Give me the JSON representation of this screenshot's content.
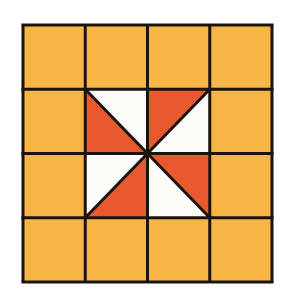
{
  "figure": {
    "title": "",
    "grid": {
      "rows": 4,
      "cols": 4
    },
    "colors": {
      "background_cell": "#f6b545",
      "accent": "#e9592f",
      "white": "#fdfbf8",
      "line": "#1a1410"
    },
    "center_cells": [
      {
        "row": 1,
        "col": 1,
        "diagonal": "tl-br",
        "accent_triangle": "bottom-left",
        "white_triangle": "top-right"
      },
      {
        "row": 1,
        "col": 2,
        "diagonal": "bl-tr",
        "accent_triangle": "top-left",
        "white_triangle": "bottom-right"
      },
      {
        "row": 2,
        "col": 1,
        "diagonal": "bl-tr",
        "accent_triangle": "bottom-right",
        "white_triangle": "top-left"
      },
      {
        "row": 2,
        "col": 2,
        "diagonal": "tl-br",
        "accent_triangle": "top-right",
        "white_triangle": "bottom-left"
      }
    ]
  }
}
